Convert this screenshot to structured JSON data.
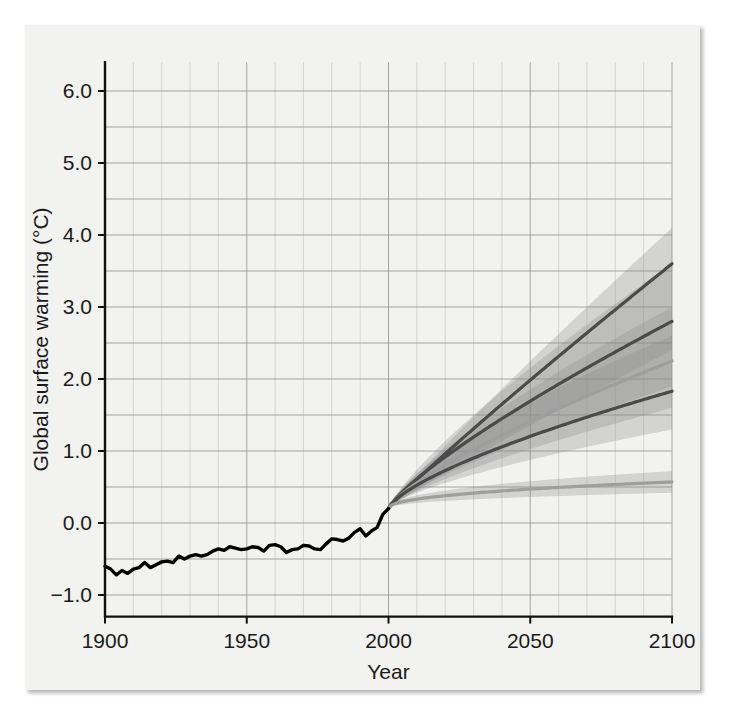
{
  "figure": {
    "background_color": "#f2f2f0",
    "panel_border_color": "#cfcfcf"
  },
  "chart_data": {
    "type": "line",
    "title": "",
    "xlabel": "Year",
    "ylabel": "Global surface warming (°C)",
    "xlim": [
      1900,
      2100
    ],
    "ylim": [
      -1.3,
      6.4
    ],
    "xticks": [
      1900,
      1950,
      2000,
      2050,
      2100
    ],
    "xtick_labels": [
      "1900",
      "1950",
      "2000",
      "2050",
      "2100"
    ],
    "yticks": [
      -1.0,
      0.0,
      1.0,
      2.0,
      3.0,
      4.0,
      5.0,
      6.0
    ],
    "ytick_labels": [
      "−1.0",
      "0.0",
      "1.0",
      "2.0",
      "3.0",
      "4.0",
      "5.0",
      "6.0"
    ],
    "grid": true,
    "grid_major_y_step": 0.5,
    "grid_minor_x_step": 10,
    "legend_position": "none",
    "x": [
      1900,
      1905,
      1910,
      1915,
      1920,
      1925,
      1930,
      1935,
      1940,
      1945,
      1950,
      1955,
      1960,
      1965,
      1970,
      1975,
      1980,
      1985,
      1990,
      1995,
      2000
    ],
    "series": [
      {
        "name": "historical-observations",
        "kind": "historical",
        "color": "#000000",
        "x": [
          1900,
          1902,
          1904,
          1906,
          1908,
          1910,
          1912,
          1914,
          1916,
          1918,
          1920,
          1922,
          1924,
          1926,
          1928,
          1930,
          1932,
          1934,
          1936,
          1938,
          1940,
          1942,
          1944,
          1946,
          1948,
          1950,
          1952,
          1954,
          1956,
          1958,
          1960,
          1962,
          1964,
          1966,
          1968,
          1970,
          1972,
          1974,
          1976,
          1978,
          1980,
          1982,
          1984,
          1986,
          1988,
          1990,
          1992,
          1994,
          1996,
          1998,
          2000
        ],
        "values": [
          -0.6,
          -0.64,
          -0.72,
          -0.66,
          -0.7,
          -0.64,
          -0.62,
          -0.55,
          -0.62,
          -0.58,
          -0.54,
          -0.53,
          -0.55,
          -0.46,
          -0.5,
          -0.46,
          -0.44,
          -0.46,
          -0.44,
          -0.39,
          -0.36,
          -0.38,
          -0.33,
          -0.35,
          -0.37,
          -0.36,
          -0.33,
          -0.34,
          -0.39,
          -0.31,
          -0.3,
          -0.33,
          -0.41,
          -0.37,
          -0.36,
          -0.31,
          -0.32,
          -0.36,
          -0.37,
          -0.29,
          -0.22,
          -0.23,
          -0.25,
          -0.21,
          -0.13,
          -0.08,
          -0.18,
          -0.11,
          -0.06,
          0.12,
          0.2
        ]
      },
      {
        "name": "A2",
        "kind": "projection",
        "color": "#4a4a4a",
        "value_2100": 3.6,
        "band_low_2100": 2.4,
        "band_high_2100": 4.1
      },
      {
        "name": "A1B",
        "kind": "projection",
        "color": "#4a4a4a",
        "value_2100": 2.8,
        "band_low_2100": 1.9,
        "band_high_2100": 3.6
      },
      {
        "name": "B2",
        "kind": "projection",
        "color": "#9e9e9e",
        "value_2100": 2.25,
        "band_low_2100": 1.6,
        "band_high_2100": 3.0
      },
      {
        "name": "B1",
        "kind": "projection",
        "color": "#4a4a4a",
        "value_2100": 1.83,
        "band_low_2100": 1.3,
        "band_high_2100": 2.6
      },
      {
        "name": "constant-composition-commitment",
        "kind": "projection",
        "color": "#9e9e9e",
        "value_2100": 0.57,
        "band_low_2100": 0.42,
        "band_high_2100": 0.72
      }
    ],
    "branch_point": {
      "year": 2000,
      "value": 0.2
    },
    "annotations": []
  }
}
